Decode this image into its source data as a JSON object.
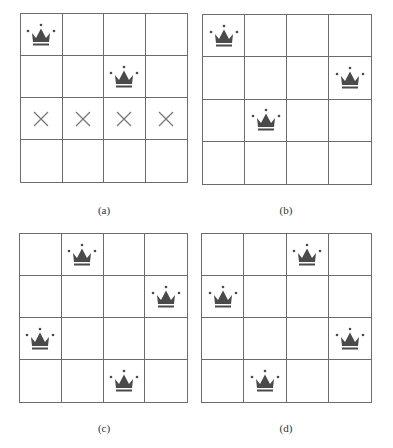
{
  "figure": {
    "colors": {
      "grid_line": "#6b6b6b",
      "crown": "#4a4a4a",
      "cross": "#777777",
      "background": "#ffffff"
    },
    "panels": [
      {
        "id": "a",
        "label": "(a)",
        "size": 4,
        "queens": [
          [
            0,
            0
          ],
          [
            1,
            2
          ]
        ],
        "crosses": [
          [
            2,
            0
          ],
          [
            2,
            1
          ],
          [
            2,
            2
          ],
          [
            2,
            3
          ]
        ]
      },
      {
        "id": "b",
        "label": "(b)",
        "size": 4,
        "queens": [
          [
            0,
            0
          ],
          [
            1,
            3
          ],
          [
            2,
            1
          ]
        ],
        "crosses": []
      },
      {
        "id": "c",
        "label": "(c)",
        "size": 4,
        "queens": [
          [
            0,
            1
          ],
          [
            1,
            3
          ],
          [
            2,
            0
          ],
          [
            3,
            2
          ]
        ],
        "crosses": []
      },
      {
        "id": "d",
        "label": "(d)",
        "size": 4,
        "queens": [
          [
            0,
            2
          ],
          [
            1,
            0
          ],
          [
            2,
            3
          ],
          [
            3,
            1
          ]
        ],
        "crosses": []
      }
    ]
  }
}
